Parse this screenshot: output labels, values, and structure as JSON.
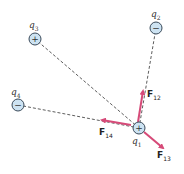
{
  "diagram": {
    "title": "",
    "charges": [
      {
        "id": "q1",
        "label": "q",
        "sub": "1",
        "sign": "+",
        "x": 139,
        "y": 128
      },
      {
        "id": "q2",
        "label": "q",
        "sub": "2",
        "sign": "−",
        "x": 156,
        "y": 28
      },
      {
        "id": "q3",
        "label": "q",
        "sub": "3",
        "sign": "+",
        "x": 35,
        "y": 39
      },
      {
        "id": "q4",
        "label": "q",
        "sub": "4",
        "sign": "−",
        "x": 18,
        "y": 105
      }
    ],
    "forces": [
      {
        "id": "F12",
        "label": "F",
        "sub": "12"
      },
      {
        "id": "F13",
        "label": "F",
        "sub": "13"
      },
      {
        "id": "F14",
        "label": "F",
        "sub": "14"
      }
    ],
    "colors": {
      "arrow": "#d64a78",
      "charge_fill": "#cde3f2",
      "charge_stroke": "#3a4a5a",
      "dash": "#333333"
    }
  }
}
